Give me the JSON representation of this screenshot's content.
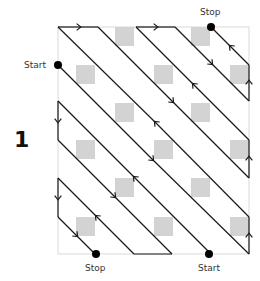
{
  "figure": {
    "number": "1",
    "labels": {
      "start_left": "Start",
      "stop_top": "Stop",
      "stop_bottom": "Stop",
      "start_bottom": "Start"
    },
    "colors": {
      "border": "#d9d9d9",
      "square": "#d3d3d3",
      "line": "#1a1a1a",
      "dot": "#000000"
    },
    "grid": {
      "box": {
        "x": 58,
        "y": 27,
        "w": 191,
        "h": 227
      },
      "squares": [
        {
          "x": 115,
          "y": 27
        },
        {
          "x": 191,
          "y": 27
        },
        {
          "x": 76,
          "y": 65
        },
        {
          "x": 154,
          "y": 65
        },
        {
          "x": 230,
          "y": 65
        },
        {
          "x": 115,
          "y": 103
        },
        {
          "x": 191,
          "y": 103
        },
        {
          "x": 76,
          "y": 140
        },
        {
          "x": 154,
          "y": 140
        },
        {
          "x": 230,
          "y": 140
        },
        {
          "x": 115,
          "y": 178
        },
        {
          "x": 191,
          "y": 178
        },
        {
          "x": 76,
          "y": 217
        },
        {
          "x": 154,
          "y": 217
        },
        {
          "x": 230,
          "y": 217
        }
      ],
      "square_size": 19
    },
    "paths": [
      {
        "name": "path-1",
        "from": "Start (left)",
        "to": "Stop (top)"
      },
      {
        "name": "path-2",
        "from": "Start (bottom)",
        "to": "Stop (bottom)"
      }
    ]
  }
}
